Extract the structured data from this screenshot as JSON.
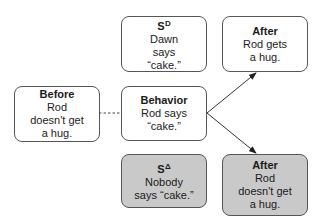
{
  "diagram": {
    "type": "three-term contingency",
    "nodes": {
      "sd": {
        "title": "S",
        "title_superscript": "D",
        "body": "Dawn\nsays\n“cake.”",
        "shaded": false
      },
      "after_top": {
        "title": "After",
        "body": "Rod gets\na hug.",
        "shaded": false
      },
      "before": {
        "title": "Before",
        "body": "Rod\ndoesn't get\na hug.",
        "shaded": false
      },
      "behavior": {
        "title": "Behavior",
        "body": "Rod says\n“cake.”",
        "shaded": false
      },
      "sdelta": {
        "title": "S",
        "title_superscript": "Δ",
        "body": "Nobody\nsays “cake.”",
        "shaded": true
      },
      "after_bottom": {
        "title": "After",
        "body": "Rod\ndoesn't get\na hug.",
        "shaded": true
      }
    },
    "edges": [
      {
        "from": "before",
        "to": "behavior",
        "style": "dashed",
        "arrow": false
      },
      {
        "from": "behavior",
        "to": "after_top",
        "style": "solid",
        "arrow": true
      },
      {
        "from": "behavior",
        "to": "after_bottom",
        "style": "solid",
        "arrow": true
      }
    ],
    "colors": {
      "border": "#555555",
      "shaded_fill": "#c9c9c9",
      "line": "#333333"
    }
  }
}
